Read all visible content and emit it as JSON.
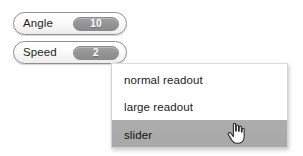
{
  "background_color": "#ffffff",
  "fields": [
    {
      "name": "angle",
      "label": "Angle",
      "value": "10"
    },
    {
      "name": "speed",
      "label": "Speed",
      "value": "2"
    }
  ],
  "dropdown": {
    "items": [
      {
        "label": "normal readout",
        "selected": false
      },
      {
        "label": "large readout",
        "selected": false
      },
      {
        "label": "slider",
        "selected": true
      }
    ],
    "highlight_color": "#a9a9a9",
    "background_color": "#ffffff"
  },
  "cursor": {
    "icon": "pointing-hand-cursor"
  }
}
